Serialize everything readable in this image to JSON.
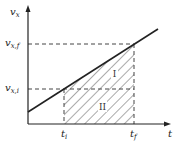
{
  "diagram": {
    "type": "velocity-time graph",
    "axes": {
      "y_label": "v",
      "y_label_sub": "x",
      "x_label": "t"
    },
    "levels": {
      "final": {
        "label": "v",
        "sub": "x,f"
      },
      "initial": {
        "label": "v",
        "sub": "x,i"
      }
    },
    "times": {
      "initial": {
        "label": "t",
        "sub": "i"
      },
      "final": {
        "label": "t",
        "sub": "f"
      }
    },
    "regions": {
      "triangle": "I",
      "rectangle": "II"
    },
    "colors": {
      "line": "#222222",
      "dash": "#444444",
      "hatch": "#555555"
    }
  }
}
